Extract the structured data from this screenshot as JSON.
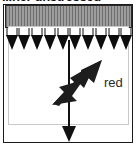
{
  "figure": {
    "caption": "...ner  unstressed",
    "annotations": {
      "red_label": "red"
    },
    "colors": {
      "ink": "#111111",
      "hatch_dark": "#6e6e6e",
      "hatch_light": "#9d9d9d",
      "hatch_fill": "#8a8a8a",
      "frame": "#1a1a1a",
      "inner_frame": "#c9c9c9",
      "label_text": "#2a2a2a",
      "background": "#ffffff"
    },
    "load_arrows": {
      "count": 10,
      "direction": "down",
      "name": "distributed-load-arrow"
    },
    "center_axis": {
      "direction": "down",
      "name": "center-axis-arrow"
    },
    "callout": {
      "direction": "up-right",
      "name": "callout-arrow"
    }
  }
}
